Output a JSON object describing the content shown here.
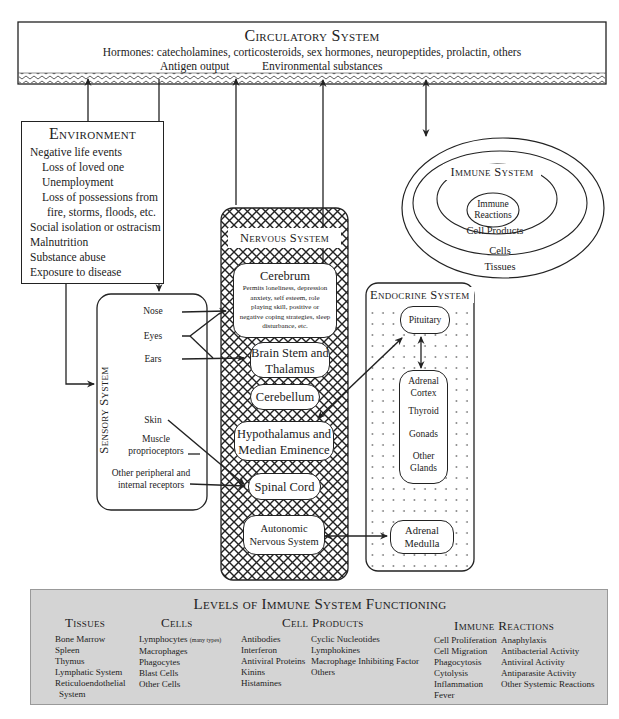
{
  "circulatory": {
    "title": "Circulatory System",
    "hormones": "Hormones: catecholamines, corticosteroids, sex hormones, neuropeptides, prolactin, others",
    "antigen_output": "Antigen output",
    "environmental_substances": "Environmental substances"
  },
  "environment": {
    "title": "Environment",
    "items": [
      {
        "text": "Negative life events",
        "indent": 0
      },
      {
        "text": "Loss of loved one",
        "indent": 1
      },
      {
        "text": "Unemployment",
        "indent": 1
      },
      {
        "text": "Loss of possessions from",
        "indent": 1
      },
      {
        "text": "fire, storms, floods, etc.",
        "indent": 2
      },
      {
        "text": "Social isolation or ostracism",
        "indent": 0
      },
      {
        "text": "Malnutrition",
        "indent": 0
      },
      {
        "text": "Substance abuse",
        "indent": 0
      },
      {
        "text": "Exposure to disease",
        "indent": 0
      }
    ]
  },
  "immune_system": {
    "title": "Immune System",
    "core": "Immune Reactions",
    "core_line1": "Immune",
    "core_line2": "Reactions",
    "ring3": "Cell Products",
    "ring2": "Cells",
    "ring1": "Tissues"
  },
  "nervous_system": {
    "title": "Nervous System",
    "cerebrum": {
      "title": "Cerebrum",
      "description": "Permits loneliness, depression anxiety, self esteem, role playing skill, positive or negative coping strategies, sleep disturbance, etc."
    },
    "brain_stem": "Brain Stem and Thalamus",
    "cerebellum": "Cerebellum",
    "hypothalamus": "Hypothalamus and Median Eminence",
    "spinal_cord": "Spinal Cord",
    "autonomic": "Autonomic Nervous System"
  },
  "endocrine_system": {
    "title": "Endocrine System",
    "pituitary": "Pituitary",
    "glands": [
      "Adrenal Cortex",
      "Thyroid",
      "Gonads",
      "Other Glands"
    ],
    "adrenal_medulla": "Adrenal Medulla"
  },
  "sensory_system": {
    "title": "Sensory System",
    "items": [
      "Nose",
      "Eyes",
      "Ears",
      "Skin",
      "Muscle proprioceptors",
      "Other peripheral and internal receptors"
    ]
  },
  "levels": {
    "title": "Levels of Immune System Functioning",
    "columns": [
      {
        "heading": "Tissues",
        "items": [
          "Bone Marrow",
          "Spleen",
          "Thymus",
          "Lymphatic System",
          "Reticuloendothelial",
          "System"
        ]
      },
      {
        "heading": "Cells",
        "items": [
          "Lymphocytes",
          "Macrophages",
          "Phagocytes",
          "Blast Cells",
          "Other Cells"
        ],
        "note": "(many types)"
      },
      {
        "heading": "Cell Products",
        "items_a": [
          "Antibodies",
          "Interferon",
          "Antiviral Proteins",
          "Kinins",
          "Histamines"
        ],
        "items_b": [
          "Cyclic Nucleotides",
          "Lymphokines",
          "Macrophage Inhibiting Factor",
          "Others"
        ]
      },
      {
        "heading": "Immune Reactions",
        "items_a": [
          "Cell Proliferation",
          "Cell Migration",
          "Phagocytosis",
          "Cytolysis",
          "Inflammation",
          "Fever"
        ],
        "items_b": [
          "Anaphylaxis",
          "Antibacterial Activity",
          "Antiviral Activity",
          "Antiparasite Activity",
          "Other Systemic Reactions"
        ]
      }
    ]
  },
  "colors": {
    "line": "#222222",
    "levels_bg": "#d4d4d4",
    "background": "#ffffff"
  }
}
